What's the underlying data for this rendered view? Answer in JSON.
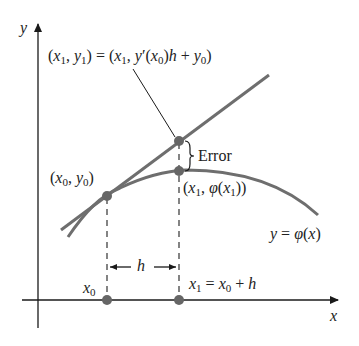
{
  "diagram": {
    "axes": {
      "x_label": "x",
      "y_label": "y"
    },
    "labels": {
      "point_tangent": "(x1, y1) = (x1, y′(x0)h + y0)",
      "error": "Error",
      "point_start": "(x0, y0)",
      "point_curve": "(x1, φ(x1))",
      "curve": "y = φ(x)",
      "step": "h",
      "x0": "x0",
      "x1": "x1 = x0 + h"
    },
    "colors": {
      "curve": "#6e6e6e",
      "tangent": "#6e6e6e",
      "axis": "#1a1a1a",
      "point": "#666666",
      "text": "#222222"
    }
  }
}
